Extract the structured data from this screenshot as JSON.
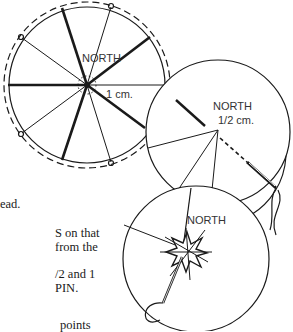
{
  "figures": [
    {
      "id": "fig-1",
      "labels": {
        "north": "NORTH",
        "measure": "1 cm."
      }
    },
    {
      "id": "fig-2",
      "labels": {
        "north": "NORTH",
        "measure": "1/2 cm."
      }
    },
    {
      "id": "fig-3",
      "labels": {
        "north": "NORTH"
      }
    }
  ],
  "body_text": {
    "lines": [
      "ead.",
      "S on that",
      "from the",
      "/2 and 1",
      " PIN.",
      "points"
    ]
  },
  "colors": {
    "ink": "#1a1a1a",
    "paper": "#ffffff"
  }
}
